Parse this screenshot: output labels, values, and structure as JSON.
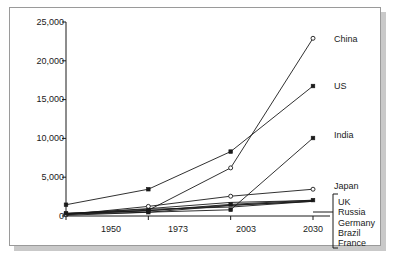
{
  "chart_data": {
    "type": "line",
    "title": "",
    "subtitle": "",
    "xlabel": "",
    "ylabel": "",
    "x": [
      1950,
      1973,
      2003,
      2030
    ],
    "xtick_labels": [
      "1950",
      "1973",
      "2003",
      "2030"
    ],
    "ytick_labels": [
      "0",
      "5,000",
      "10,000",
      "15,000",
      "20,000",
      "25,000"
    ],
    "ytick_values": [
      0,
      5000,
      10000,
      15000,
      20000,
      25000
    ],
    "ylim": [
      0,
      25000
    ],
    "xlim": [
      1950,
      2030
    ],
    "grid": false,
    "legend_position": "right-inline-labels",
    "line_color": "#1a1a1a",
    "series": [
      {
        "name": "China",
        "label": "China",
        "marker": "circle-open",
        "values": [
          240,
          740,
          6200,
          22900
        ]
      },
      {
        "name": "US",
        "label": "US",
        "marker": "square-filled",
        "values": [
          1450,
          3450,
          8300,
          16750
        ]
      },
      {
        "name": "India",
        "label": "India",
        "marker": "square-filled",
        "values": [
          220,
          490,
          800,
          10050
        ]
      },
      {
        "name": "Japan",
        "label": "Japan",
        "marker": "circle-open",
        "values": [
          160,
          1240,
          2550,
          3450
        ]
      },
      {
        "name": "UK",
        "label": "UK",
        "marker": "square-filled",
        "values": [
          350,
          680,
          1500,
          2050
        ]
      },
      {
        "name": "Russia",
        "label": "Russia",
        "marker": "none",
        "values": [
          330,
          870,
          1150,
          1900
        ]
      },
      {
        "name": "Germany",
        "label": "Germany",
        "marker": "none",
        "values": [
          300,
          950,
          1750,
          2000
        ]
      },
      {
        "name": "Brazil",
        "label": "Brazil",
        "marker": "none",
        "values": [
          90,
          480,
          1350,
          1950
        ]
      },
      {
        "name": "France",
        "label": "France",
        "marker": "none",
        "values": [
          230,
          680,
          1400,
          1880
        ]
      }
    ],
    "bracket_group": {
      "labels": [
        "UK",
        "Russia",
        "Germany",
        "Brazil",
        "France"
      ]
    },
    "annotations": []
  },
  "labels": {
    "china": "China",
    "us": "US",
    "india": "India",
    "japan": "Japan",
    "uk": "UK",
    "russia": "Russia",
    "germany": "Germany",
    "brazil": "Brazil",
    "france": "France"
  },
  "yticks": {
    "t0": "0",
    "t1": "5,000",
    "t2": "10,000",
    "t3": "15,000",
    "t4": "20,000",
    "t5": "25,000"
  },
  "xticks": {
    "t0": "1950",
    "t1": "1973",
    "t2": "2003",
    "t3": "2030"
  }
}
